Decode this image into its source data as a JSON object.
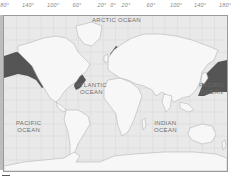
{
  "map": {
    "type": "world-map",
    "projection": "equirectangular",
    "longitude_labels": [
      {
        "label": "180°",
        "x": 3
      },
      {
        "label": "140°",
        "x": 28
      },
      {
        "label": "100°",
        "x": 53
      },
      {
        "label": "60°",
        "x": 77
      },
      {
        "label": "20°",
        "x": 102
      },
      {
        "label": "0°",
        "x": 113
      },
      {
        "label": "20°",
        "x": 126
      },
      {
        "label": "60°",
        "x": 151
      },
      {
        "label": "100°",
        "x": 176
      },
      {
        "label": "140°",
        "x": 200
      },
      {
        "label": "180°",
        "x": 225
      }
    ],
    "oceans": {
      "arctic": {
        "line1": "ARCTIC",
        "line2": "OCEAN"
      },
      "atlantic": {
        "line1": "ATLANTIC",
        "line2": "OCEAN"
      },
      "pacific_west": {
        "line1": "PACIFIC",
        "line2": "OCEAN"
      },
      "pacific_east": {
        "line1": "PACIFIC",
        "line2": "OCEAN"
      },
      "indian": {
        "line1": "INDIAN",
        "line2": "OCEAN"
      }
    },
    "colors": {
      "ocean": "#e9e9e9",
      "land": "#f7f7f7",
      "coast": "#b5b5b5",
      "highlight": "#555555",
      "grid": "#d6d6d6"
    },
    "highlighted_regions": [
      "North Pacific (Bering Sea / Alaska)",
      "Northwest Pacific (Japan / Kamchatka)",
      "Northwest Atlantic coast",
      "Norwegian Sea coast"
    ]
  }
}
